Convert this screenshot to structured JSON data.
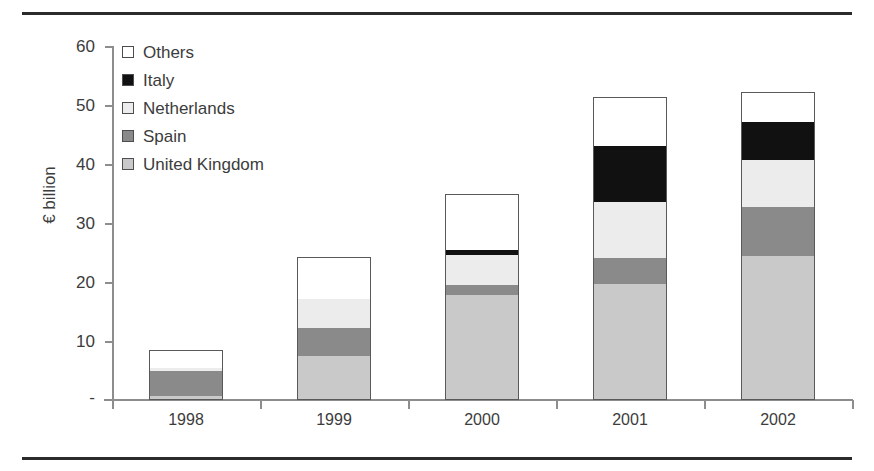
{
  "chart_data": {
    "type": "bar",
    "title": "",
    "subtitle": "",
    "xlabel": "",
    "ylabel": "€ billion",
    "categories": [
      "1998",
      "1999",
      "2000",
      "2001",
      "2002"
    ],
    "ylim": [
      0,
      60
    ],
    "yticks": [
      0,
      10,
      20,
      30,
      40,
      50,
      60
    ],
    "ytick_labels": [
      "-",
      "10",
      "20",
      "30",
      "40",
      "50",
      "60"
    ],
    "grid": false,
    "stacked": true,
    "legend_position": "upper-left-inside",
    "legend_order_top_to_bottom": [
      "Others",
      "Italy",
      "Netherlands",
      "Spain",
      "United Kingdom"
    ],
    "series": [
      {
        "name": "United Kingdom",
        "color": "#c9c9c9",
        "values": [
          0.7,
          7.5,
          17.8,
          19.8,
          24.5
        ]
      },
      {
        "name": "Spain",
        "color": "#8a8a8a",
        "values": [
          4.2,
          4.7,
          1.8,
          4.3,
          8.3
        ]
      },
      {
        "name": "Netherlands",
        "color": "#ececec",
        "values": [
          0.6,
          5.0,
          5.0,
          9.6,
          8.0
        ]
      },
      {
        "name": "Italy",
        "color": "#111111",
        "values": [
          0.0,
          0.0,
          0.9,
          9.5,
          6.5
        ]
      },
      {
        "name": "Others",
        "color": "#ffffff",
        "values": [
          3.0,
          7.1,
          9.5,
          8.3,
          5.0
        ]
      }
    ],
    "totals": [
      8.5,
      24.3,
      35.0,
      51.5,
      52.3
    ]
  },
  "legend": {
    "items": [
      {
        "label": "Others",
        "swatch_name": "legend-swatch-others"
      },
      {
        "label": "Italy",
        "swatch_name": "legend-swatch-italy"
      },
      {
        "label": "Netherlands",
        "swatch_name": "legend-swatch-netherlands"
      },
      {
        "label": "Spain",
        "swatch_name": "legend-swatch-spain"
      },
      {
        "label": "United Kingdom",
        "swatch_name": "legend-swatch-united-kingdom"
      }
    ]
  },
  "axes": {
    "y_title": "€ billion",
    "y_tick_labels": [
      "60",
      "50",
      "40",
      "30",
      "20",
      "10",
      "-"
    ],
    "x_tick_labels": [
      "1998",
      "1999",
      "2000",
      "2001",
      "2002"
    ]
  },
  "colors": {
    "others": "#ffffff",
    "italy": "#111111",
    "netherlands": "#ececec",
    "spain": "#8a8a8a",
    "united_kingdom": "#c9c9c9",
    "axis": "#8d8d8d",
    "rule": "#2b2b2b",
    "text": "#3c3c3c"
  }
}
